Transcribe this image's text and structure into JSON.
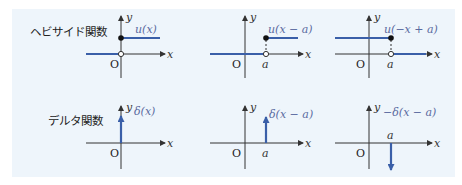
{
  "rows": [
    {
      "title": "ヘビサイド関数",
      "plots": [
        {
          "func_label": "u(x)",
          "origin": "O",
          "x_label": "x",
          "y_label": "y",
          "a_label": ""
        },
        {
          "func_label": "u(x − a)",
          "origin": "O",
          "x_label": "x",
          "y_label": "y",
          "a_label": "a"
        },
        {
          "func_label": "u(−x + a)",
          "origin": "O",
          "x_label": "x",
          "y_label": "y",
          "a_label": "a"
        }
      ]
    },
    {
      "title": "デルタ関数",
      "plots": [
        {
          "func_label": "δ(x)",
          "origin": "O",
          "x_label": "x",
          "y_label": "y",
          "a_label": ""
        },
        {
          "func_label": "δ(x − a)",
          "origin": "O",
          "x_label": "x",
          "y_label": "y",
          "a_label": "a"
        },
        {
          "func_label": "−δ(x − a)",
          "origin": "O",
          "x_label": "x",
          "y_label": "y",
          "a_label": "a"
        }
      ]
    }
  ],
  "colors": {
    "panel_bg": "#eef5fb",
    "function_line": "#3a5fa8",
    "axis": "#333333",
    "func_label": "#5a6aa0"
  }
}
